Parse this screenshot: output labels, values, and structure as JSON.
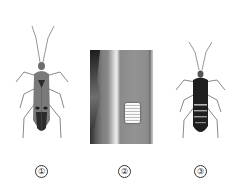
{
  "figure": {
    "panels": [
      {
        "id": 1,
        "label": "①",
        "subject": "adult insect (dorsal view, reddish body with dark markings)"
      },
      {
        "id": 2,
        "label": "②",
        "subject": "egg mass on plant stem (photograph)"
      },
      {
        "id": 3,
        "label": "③",
        "subject": "nymph insect (dorsal view, dark banded body)"
      }
    ]
  }
}
